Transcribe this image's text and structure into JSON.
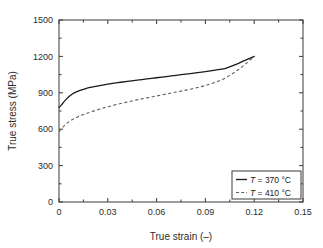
{
  "chart_data": {
    "type": "line",
    "title": "",
    "xlabel": "True strain (–)",
    "ylabel": "True stress (MPa)",
    "xlim": [
      0,
      0.15
    ],
    "ylim": [
      0,
      1500
    ],
    "xticks": [
      "0",
      "0.03",
      "0.06",
      "0.09",
      "0.12",
      "0.15"
    ],
    "xtick_values": [
      0,
      0.03,
      0.06,
      0.09,
      0.12,
      0.15
    ],
    "yticks": [
      "0",
      "300",
      "600",
      "900",
      "1200",
      "1500"
    ],
    "ytick_values": [
      0,
      300,
      600,
      900,
      1200,
      1500
    ],
    "minor_ticks": true,
    "grid": false,
    "legend_position": "lower right",
    "series": [
      {
        "name": "T = 370 °C",
        "style": "solid",
        "color": "#1a1a1a",
        "x": [
          0.0,
          0.0008,
          0.0018,
          0.003,
          0.0045,
          0.006,
          0.008,
          0.01,
          0.013,
          0.016,
          0.02,
          0.025,
          0.03,
          0.036,
          0.042,
          0.048,
          0.054,
          0.06,
          0.066,
          0.072,
          0.078,
          0.084,
          0.09,
          0.096,
          0.102,
          0.108,
          0.114,
          0.12
        ],
        "y": [
          780,
          790,
          805,
          825,
          848,
          868,
          888,
          903,
          920,
          933,
          946,
          960,
          971,
          983,
          994,
          1004,
          1014,
          1024,
          1034,
          1044,
          1054,
          1064,
          1075,
          1087,
          1100,
          1130,
          1165,
          1200
        ]
      },
      {
        "name": "T = 410 °C",
        "style": "dashed",
        "color": "#5e5e5e",
        "x": [
          0.0,
          0.0008,
          0.0018,
          0.003,
          0.0045,
          0.006,
          0.008,
          0.01,
          0.013,
          0.016,
          0.02,
          0.025,
          0.03,
          0.036,
          0.042,
          0.048,
          0.054,
          0.06,
          0.066,
          0.072,
          0.078,
          0.084,
          0.09,
          0.096,
          0.102,
          0.108,
          0.114,
          0.12
        ],
        "y": [
          580,
          592,
          608,
          626,
          645,
          660,
          678,
          692,
          710,
          726,
          744,
          766,
          785,
          806,
          824,
          842,
          858,
          874,
          890,
          906,
          922,
          940,
          960,
          986,
          1020,
          1070,
          1130,
          1200
        ]
      }
    ],
    "legend_entries": [
      {
        "label_prefix": "T",
        "label_rest": " = 370 °C",
        "style": "solid"
      },
      {
        "label_prefix": "T",
        "label_rest": " = 410 °C",
        "style": "dashed"
      }
    ]
  }
}
